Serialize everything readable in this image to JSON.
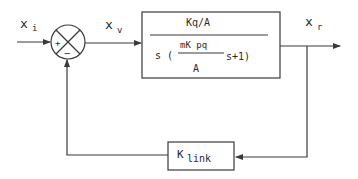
{
  "diagram": {
    "type": "block-diagram",
    "signals": {
      "input": {
        "main": "x",
        "sub": "i"
      },
      "error": {
        "main": "x",
        "sub": "v"
      },
      "output": {
        "main": "x",
        "sub": "r"
      }
    },
    "summing_junction": {
      "plus_sign": "+",
      "minus_sign": "−"
    },
    "forward_block": {
      "numerator": "Kq/A",
      "denominator_prefix": "s (",
      "inner_fraction_numerator": "mK pq",
      "inner_fraction_denominator": "A",
      "denominator_suffix": "s+1)"
    },
    "feedback_block": {
      "main": "K",
      "sub": "link"
    },
    "colors": {
      "stroke": "#3a3a3a",
      "text": "#2a2a2a",
      "background": "#ffffff"
    }
  }
}
